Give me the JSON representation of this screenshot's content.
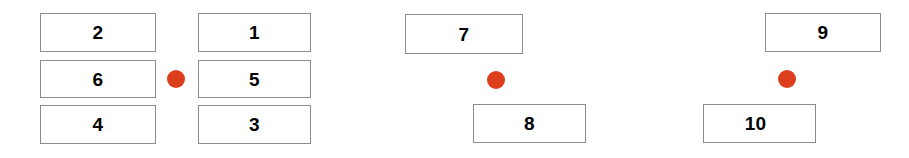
{
  "diagram": {
    "type": "numbered-box-groups",
    "background_color": "#ffffff",
    "box_border_color": "#8c8c8c",
    "box_fill_color": "#ffffff",
    "label_color": "#000000",
    "marker_color": "#dd3e1c",
    "groups": [
      {
        "name": "left-group",
        "boxes": [
          {
            "label": "2",
            "x": 40,
            "y": 13,
            "w": 116,
            "h": 39,
            "align": "center"
          },
          {
            "label": "1",
            "x": 198,
            "y": 13,
            "w": 113,
            "h": 39,
            "align": "center"
          },
          {
            "label": "6",
            "x": 40,
            "y": 60,
            "w": 116,
            "h": 38,
            "align": "center"
          },
          {
            "label": "5",
            "x": 198,
            "y": 60,
            "w": 113,
            "h": 38,
            "align": "center"
          },
          {
            "label": "4",
            "x": 40,
            "y": 105,
            "w": 116,
            "h": 39,
            "align": "center"
          },
          {
            "label": "3",
            "x": 198,
            "y": 105,
            "w": 113,
            "h": 39,
            "align": "center"
          }
        ],
        "markers": [
          {
            "cx": 176,
            "cy": 79,
            "r": 9
          }
        ]
      },
      {
        "name": "middle-group",
        "boxes": [
          {
            "label": "7",
            "x": 405,
            "y": 14,
            "w": 118,
            "h": 40,
            "align": "center"
          },
          {
            "label": "8",
            "x": 473,
            "y": 104,
            "w": 113,
            "h": 39,
            "align": "center"
          }
        ],
        "markers": [
          {
            "cx": 496,
            "cy": 80,
            "r": 9
          }
        ]
      },
      {
        "name": "right-group",
        "boxes": [
          {
            "label": "9",
            "x": 765,
            "y": 13,
            "w": 116,
            "h": 39,
            "align": "center"
          },
          {
            "label": "10",
            "x": 703,
            "y": 104,
            "w": 113,
            "h": 39,
            "align": "left"
          }
        ],
        "markers": [
          {
            "cx": 787,
            "cy": 79,
            "r": 9
          }
        ]
      }
    ]
  }
}
